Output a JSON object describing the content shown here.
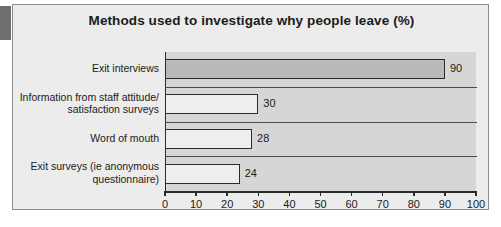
{
  "accent": {
    "name": "left-accent-block",
    "color": "#6e6e6e"
  },
  "card": {
    "background": "#ececec",
    "border_color": "#8c8c8c"
  },
  "chart_data": {
    "type": "bar",
    "orientation": "horizontal",
    "title": "Methods used to investigate why people leave (%)",
    "xlabel": "",
    "ylabel": "",
    "xlim": [
      0,
      100
    ],
    "grid": false,
    "legend": null,
    "categories": [
      "Exit interviews",
      "Information from staff attitude/ satisfaction surveys",
      "Word of mouth",
      "Exit surveys (ie anonymous questionnaire)"
    ],
    "category_lines": [
      [
        "Exit interviews"
      ],
      [
        "Information from staff attitude/",
        "satisfaction surveys"
      ],
      [
        "Word of mouth"
      ],
      [
        "Exit surveys (ie anonymous",
        "questionnaire)"
      ]
    ],
    "values": [
      90,
      30,
      28,
      24
    ],
    "value_labels": [
      "90",
      "30",
      "28",
      "24"
    ],
    "bar_colors": [
      "#b9b9b9",
      "#eeeeee",
      "#eeeeee",
      "#eeeeee"
    ],
    "bar_border_color": "#2b2b2b",
    "xticks": [
      0,
      10,
      20,
      30,
      40,
      50,
      60,
      70,
      80,
      90,
      100
    ],
    "xtick_labels": [
      "0",
      "10",
      "20",
      "30",
      "40",
      "50",
      "60",
      "70",
      "80",
      "90",
      "100"
    ],
    "plot_background": "#d6d6d6",
    "axis_color": "#2b2b2b"
  }
}
